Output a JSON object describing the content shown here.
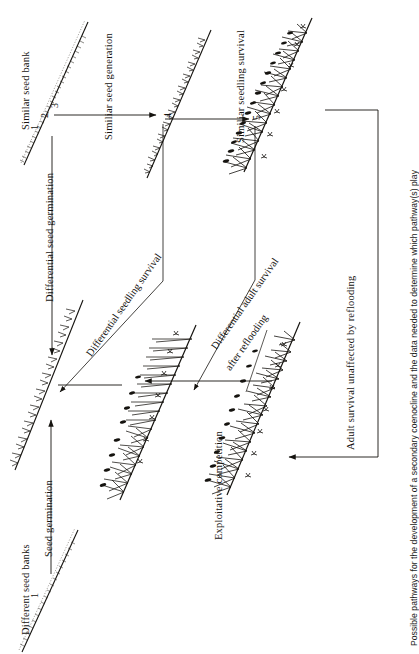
{
  "figure": {
    "orientation": "rotated-90-ccw",
    "caption": "Possible pathways for the development of a secondary coenocline and the data needed to determine which pathway(s) play",
    "ink_color": "#15130f",
    "background_color": "#ffffff"
  },
  "labels": {
    "similar_seed_bank": "Similar seed bank",
    "similar_seed_generation": "Similiar seed generation",
    "similar_seedling_survival": "Similiar seedling survival",
    "differential_seed_germination": "Differential seed germination",
    "differential_seedling_survival": "Differential seedling survival",
    "differential_adult_survival_line1": "Differential adult survival",
    "differential_adult_survival_line2": "after reflooding",
    "seed_germination": "Seed germination",
    "different_seed_banks": "Different seed banks",
    "exploitative_competition": "Exploitative competition",
    "adult_survival_unaffected": "Adult survival unaffected by reflooding"
  },
  "stage_numbers": {
    "top_transect": [
      "1",
      "2",
      "3"
    ],
    "seedling_transect": "4",
    "adult_transect": "5",
    "bottom_left_transect": "1"
  },
  "panels": [
    {
      "id": "seed-bank-similar",
      "name": "similar-seed-bank-transect",
      "stage": "1 2 3",
      "style": "dotted-seed-bank"
    },
    {
      "id": "seed-bank-different",
      "name": "different-seed-banks-transect",
      "stage": "1",
      "style": "dotted-seed-bank"
    },
    {
      "id": "seedlings-similar",
      "name": "similar-seedlings-transect",
      "stage": "4",
      "style": "sparse-seedlings"
    },
    {
      "id": "seedlings-differential",
      "name": "differential-seedlings-transect",
      "stage": "",
      "style": "dense-seedlings"
    },
    {
      "id": "adults-similar",
      "name": "similar-adults-transect",
      "stage": "5",
      "style": "flowering-adults"
    },
    {
      "id": "adults-competition",
      "name": "competition-adults-transect",
      "stage": "",
      "style": "flowering-adults-sparse"
    },
    {
      "id": "adults-reflooded",
      "name": "reflooded-adults-transect",
      "stage": "",
      "style": "flowering-adults"
    }
  ],
  "arrows": [
    {
      "name": "arrow-seedbank-to-seedlings",
      "label_ref": "similar_seed_generation"
    },
    {
      "name": "arrow-seedlings-to-adults",
      "label_ref": "similar_seedling_survival"
    },
    {
      "name": "arrow-differential-germination",
      "label_ref": "differential_seed_germination"
    },
    {
      "name": "arrow-differential-seedling",
      "label_ref": "differential_seedling_survival"
    },
    {
      "name": "arrow-differential-adult",
      "label_ref": "differential_adult_survival_line1"
    },
    {
      "name": "arrow-seed-germination-up",
      "label_ref": "seed_germination"
    },
    {
      "name": "arrow-exploitative-competition",
      "label_ref": "exploitative_competition"
    },
    {
      "name": "arrow-adult-unaffected",
      "label_ref": "adult_survival_unaffected"
    }
  ]
}
